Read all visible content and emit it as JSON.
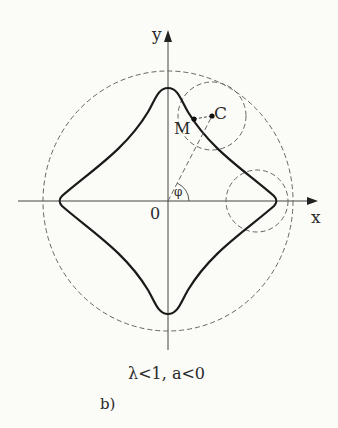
{
  "figure": {
    "axis_x_label": "x",
    "axis_y_label": "y",
    "origin_label": "0",
    "point_m_label": "M",
    "point_c_label": "C",
    "angle_label": "φ",
    "caption": "λ<1, a<0",
    "panel_label": "b)"
  }
}
